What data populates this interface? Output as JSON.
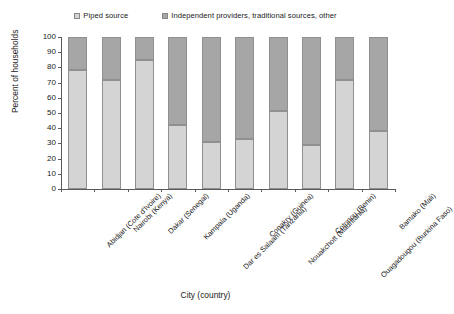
{
  "chart_data": {
    "type": "bar",
    "subtype": "stacked-bar-100",
    "title": "",
    "xlabel": "City (country)",
    "ylabel": "Percent of households",
    "ylim": [
      0,
      100
    ],
    "yticks": [
      0,
      10,
      20,
      30,
      40,
      50,
      60,
      70,
      80,
      90,
      100
    ],
    "grid": false,
    "legend_position": "top",
    "categories": [
      "Abidjan (Cote d'Ivoire)",
      "Nairobi (Kenya)",
      "Dakar (Senegal)",
      "Kampala (Uganda)",
      "Dar es Salaam (Tanzania)",
      "Conakry (Guinea)",
      "Nouakchott (Mauritania)",
      "Cotonou (Benin)",
      "Ouagadougou (Burkina Faso)",
      "Bamako (Mali)"
    ],
    "series": [
      {
        "name": "Piped source",
        "color": "#d4d4d4",
        "values": [
          78,
          72,
          85,
          42,
          31,
          33,
          51,
          29,
          72,
          38
        ]
      },
      {
        "name": "Independent providers, traditional sources, other",
        "color": "#a6a6a6",
        "values": [
          22,
          28,
          15,
          58,
          69,
          67,
          49,
          71,
          28,
          62
        ]
      }
    ]
  },
  "legend": {
    "entries": [
      {
        "label": "Piped source"
      },
      {
        "label": "Independent providers, traditional sources, other"
      }
    ]
  },
  "axes": {
    "y_title": "Percent of households",
    "x_title": "City (country)",
    "y_tick_labels": [
      "100",
      "90",
      "80",
      "70",
      "60",
      "50",
      "40",
      "30",
      "20",
      "10",
      "0"
    ]
  },
  "colors": {
    "piped": "#d4d4d4",
    "independent": "#a6a6a6",
    "axis": "#5a5a5a",
    "bar_border": "#909090",
    "background": "#ffffff"
  }
}
